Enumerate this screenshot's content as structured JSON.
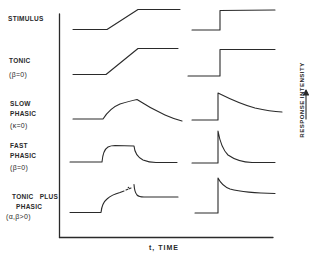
{
  "diagram": {
    "rows": [
      {
        "id": "stimulus",
        "lines": [
          "STIMULUS"
        ]
      },
      {
        "id": "tonic",
        "lines": [
          "TONIC",
          "(β=0)"
        ]
      },
      {
        "id": "slow-phasic",
        "lines": [
          "SLOW",
          "PHASIC",
          "(κ=0)"
        ]
      },
      {
        "id": "fast-phasic",
        "lines": [
          "FAST",
          "PHASIC",
          "(β=0)"
        ]
      },
      {
        "id": "tonic-plus-phasic",
        "lines": [
          "TONIC PLUS",
          "PHASIC",
          "(α,β>0)"
        ]
      }
    ],
    "x_axis_label": "t,  TIME",
    "y_axis_label": "RESPONSE   INTENSITY",
    "columns": [
      "ramp stimulus",
      "step stimulus"
    ],
    "colors": {
      "line": "#2a2a2a",
      "background": "#ffffff"
    }
  }
}
